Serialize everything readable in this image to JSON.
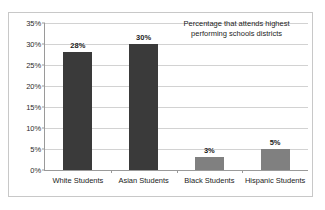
{
  "chart_data": {
    "type": "bar",
    "title": "",
    "xlabel": "",
    "ylabel": "",
    "categories": [
      "White Students",
      "Asian Students",
      "Black Students",
      "Hispanic Students"
    ],
    "values": [
      28,
      30,
      3,
      5
    ],
    "value_labels": [
      "28%",
      "30%",
      "3%",
      "5%"
    ],
    "ylim": [
      0,
      35
    ],
    "ytick_values": [
      35,
      30,
      25,
      20,
      15,
      10,
      5,
      0
    ],
    "ytick_labels": [
      "35%",
      "30%",
      "25%",
      "20%",
      "15%",
      "10%",
      "5%",
      "0%"
    ],
    "grid": true,
    "legend": "none",
    "annotation": "Percentage that attends highest performing schools districts",
    "bar_colors": [
      "#3a3a3a",
      "#3a3a3a",
      "#808080",
      "#808080"
    ],
    "colors": {
      "plot_background": "#ffffff",
      "gridline": "#d2d2d2",
      "axis_line": "#9a9a9a",
      "frame_border": "#c8c8c8",
      "text": "#1c1c1c",
      "bar_dark": "#3a3a3a",
      "bar_light": "#808080"
    }
  }
}
